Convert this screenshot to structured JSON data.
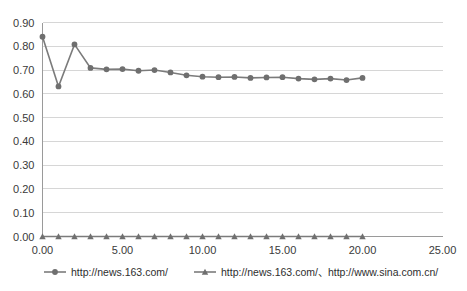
{
  "chart_data": {
    "type": "line",
    "title": "",
    "xlabel": "",
    "ylabel": "",
    "xlim": [
      0,
      25
    ],
    "ylim": [
      0,
      0.9
    ],
    "grid": true,
    "legend_position": "bottom",
    "x_ticks": [
      "0.00",
      "5.00",
      "10.00",
      "15.00",
      "20.00",
      "25.00"
    ],
    "x_tick_values": [
      0,
      5,
      10,
      15,
      20,
      25
    ],
    "y_ticks": [
      "0.00",
      "0.10",
      "0.20",
      "0.30",
      "0.40",
      "0.50",
      "0.60",
      "0.70",
      "0.80",
      "0.90"
    ],
    "y_tick_values": [
      0,
      0.1,
      0.2,
      0.3,
      0.4,
      0.5,
      0.6,
      0.7,
      0.8,
      0.9
    ],
    "x": [
      0,
      1,
      2,
      3,
      4,
      5,
      6,
      7,
      8,
      9,
      10,
      11,
      12,
      13,
      14,
      15,
      16,
      17,
      18,
      19,
      20
    ],
    "series": [
      {
        "name": "http://news.163.com/",
        "marker": "circle",
        "color": "#6f6f6f",
        "values": [
          0.84,
          0.631,
          0.808,
          0.709,
          0.703,
          0.704,
          0.697,
          0.7,
          0.69,
          0.678,
          0.672,
          0.67,
          0.671,
          0.667,
          0.669,
          0.67,
          0.664,
          0.661,
          0.664,
          0.658,
          0.667
        ]
      },
      {
        "name": "http://news.163.com/、http://www.sina.com.cn/",
        "marker": "triangle",
        "color": "#6f6f6f",
        "values": [
          0,
          0,
          0,
          0,
          0,
          0,
          0,
          0,
          0,
          0,
          0,
          0,
          0,
          0,
          0,
          0,
          0,
          0,
          0,
          0,
          0
        ]
      }
    ]
  },
  "legend": {
    "entries": [
      {
        "label": "http://news.163.com/"
      },
      {
        "label": "http://news.163.com/、http://www.sina.com.cn/"
      }
    ]
  }
}
